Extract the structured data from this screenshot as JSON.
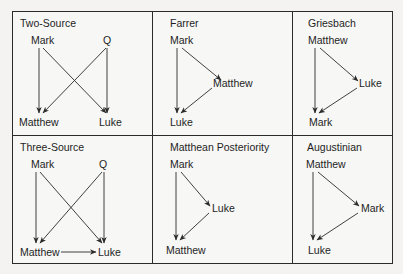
{
  "figure": {
    "colors": {
      "line": "#2b2b2b",
      "text": "#1e1e1e",
      "background": "#f4f3f1"
    },
    "hypotheses": [
      {
        "title": "Two-Source",
        "nodes": {
          "a": "Mark",
          "b": "Q",
          "c": "Matthew",
          "d": "Luke"
        },
        "edges": [
          [
            "Mark",
            "Matthew"
          ],
          [
            "Mark",
            "Luke"
          ],
          [
            "Q",
            "Matthew"
          ],
          [
            "Q",
            "Luke"
          ]
        ]
      },
      {
        "title": "Farrer",
        "nodes": {
          "a": "Mark",
          "b": "Matthew",
          "c": "Luke"
        },
        "edges": [
          [
            "Mark",
            "Matthew"
          ],
          [
            "Mark",
            "Luke"
          ],
          [
            "Matthew",
            "Luke"
          ]
        ]
      },
      {
        "title": "Griesbach",
        "nodes": {
          "a": "Matthew",
          "b": "Luke",
          "c": "Mark"
        },
        "edges": [
          [
            "Matthew",
            "Luke"
          ],
          [
            "Matthew",
            "Mark"
          ],
          [
            "Luke",
            "Mark"
          ]
        ]
      },
      {
        "title": "Three-Source",
        "nodes": {
          "a": "Mark",
          "b": "Q",
          "c": "Matthew",
          "d": "Luke"
        },
        "edges": [
          [
            "Mark",
            "Matthew"
          ],
          [
            "Mark",
            "Luke"
          ],
          [
            "Q",
            "Matthew"
          ],
          [
            "Q",
            "Luke"
          ],
          [
            "Matthew",
            "Luke"
          ]
        ]
      },
      {
        "title": "Matthean Posteriority",
        "nodes": {
          "a": "Mark",
          "b": "Luke",
          "c": "Matthew"
        },
        "edges": [
          [
            "Mark",
            "Luke"
          ],
          [
            "Mark",
            "Matthew"
          ],
          [
            "Luke",
            "Matthew"
          ]
        ]
      },
      {
        "title": "Augustinian",
        "nodes": {
          "a": "Matthew",
          "b": "Mark",
          "c": "Luke"
        },
        "edges": [
          [
            "Matthew",
            "Mark"
          ],
          [
            "Matthew",
            "Luke"
          ],
          [
            "Mark",
            "Luke"
          ]
        ]
      }
    ]
  }
}
